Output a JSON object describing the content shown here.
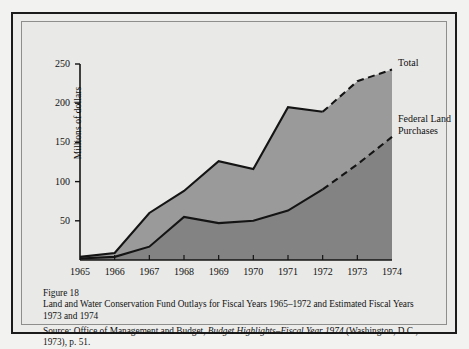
{
  "figure": {
    "number_label": "Figure 18",
    "title": "Land and Water Conservation Fund Outlays for Fiscal Years 1965–1972 and Estimated Fiscal Years 1973 and 1974",
    "source_prefix": "Source:  Office of Management and Budget, ",
    "source_italic": "Budget Highlights–Fiscal Year 1974",
    "source_suffix": " (Washington, D.C., 1973), p. 51."
  },
  "labels": {
    "total": "Total",
    "federal_land_purchases": "Federal Land\nPurchases"
  },
  "colors": {
    "page_background": "#f2f2f0",
    "figure_background": "#e9e9e7",
    "frame_dark": "#1b1b1b",
    "frame_light": "#8e8e8c",
    "band_total": "#9a9a9a",
    "band_federal": "#838383",
    "line": "#141414"
  },
  "chart_data": {
    "type": "area",
    "title": "Land and Water Conservation Fund Outlays for Fiscal Years 1965–1972 and Estimated Fiscal Years 1973 and 1974",
    "xlabel": "",
    "ylabel": "Millions of dollars",
    "categories": [
      "1965",
      "1966",
      "1967",
      "1968",
      "1969",
      "1970",
      "1971",
      "1972",
      "1973",
      "1974"
    ],
    "x_tick_labels": [
      "1965",
      "1966",
      "1967",
      "1968",
      "1969",
      "1970",
      "1971",
      "1972",
      "1973",
      "1974"
    ],
    "y_tick_labels": [
      "50",
      "100",
      "150",
      "200",
      "250"
    ],
    "y_ticks": [
      50,
      100,
      150,
      200,
      250
    ],
    "ylim": [
      0,
      250
    ],
    "grid": false,
    "legend_position": "right-inline",
    "estimated_from": "1972",
    "estimated_years": [
      "1973",
      "1974"
    ],
    "series": [
      {
        "name": "Total",
        "values": [
          4,
          9,
          60,
          88,
          126,
          116,
          195,
          189,
          228,
          243
        ],
        "stacked_top": true,
        "line_style_actual": "solid",
        "line_style_estimated": "dashed"
      },
      {
        "name": "Federal Land Purchases",
        "values": [
          2,
          4,
          17,
          55,
          47,
          50,
          63,
          90,
          122,
          157
        ],
        "line_style_actual": "solid",
        "line_style_estimated": "dashed"
      }
    ],
    "annotations": [
      {
        "text": "Total",
        "attached_to": "Total",
        "at_x": "1974"
      },
      {
        "text": "Federal Land Purchases",
        "attached_to": "Federal Land Purchases",
        "at_x": "1974"
      }
    ]
  }
}
